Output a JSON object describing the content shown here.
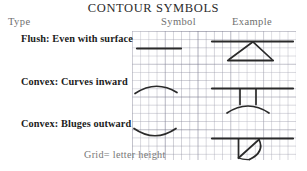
{
  "title": "CONTOUR SYMBOLS",
  "headers": {
    "type": "Type",
    "symbol": "Symbol",
    "example": "Example"
  },
  "footer": "Grid= letter height",
  "colors": {
    "ink": "#2a2a2a",
    "grid_line": "#7878 8c",
    "header_text": "#6f6f6f",
    "label_text": "#1c1c1c",
    "title_text": "#2b2b2b",
    "background": "#ffffff"
  },
  "rows": [
    {
      "label": "Flush: Even with surface",
      "symbol_name": "straight-horizontal-line-symbol",
      "example_name": "flush-surface-example"
    },
    {
      "label": "Convex: Curves inward",
      "symbol_name": "arc-curving-up-symbol",
      "example_name": "convex-inward-example"
    },
    {
      "label": "Convex: Bluges outward",
      "symbol_name": "arc-curving-down-symbol",
      "example_name": "convex-outward-example"
    }
  ],
  "grid": {
    "cell_size_px": 8.2,
    "note": "letter height"
  }
}
